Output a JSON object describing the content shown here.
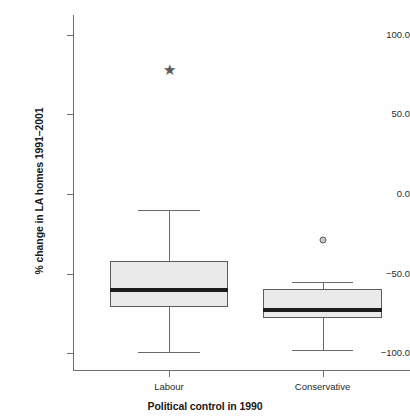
{
  "chart_data": {
    "type": "box",
    "title": "",
    "xlabel": "Political control in 1990",
    "ylabel": "% change in LA homes 1991–2001",
    "categories": [
      "Labour",
      "Conservative"
    ],
    "ylim": [
      -110.0,
      110.0
    ],
    "yticks": [
      100.0,
      50.0,
      0.0,
      -50.0,
      -100.0
    ],
    "ytick_labels": [
      "100.0",
      "50.0",
      "0.0",
      "−50.0",
      "−100.0"
    ],
    "grid": false,
    "legend": "none",
    "boxes": [
      {
        "category": "Labour",
        "whisker_low": -99.0,
        "q1": -71.2,
        "median": -60.5,
        "q3": -42.3,
        "whisker_high": -9.8,
        "outliers": [
          {
            "value": 78.2,
            "marker": "star"
          }
        ]
      },
      {
        "category": "Conservative",
        "whisker_low": -98.0,
        "q1": -77.7,
        "median": -72.7,
        "q3": -59.7,
        "whisker_high": -55.1,
        "outliers": [
          {
            "value": -29.1,
            "marker": "circle"
          }
        ]
      }
    ],
    "colors": {
      "box_fill": "#eaeaea",
      "box_edge": "#5c5c5c",
      "median": "#1c1c1c",
      "whisker": "#6a6a6a",
      "outlier": "#5a5a5a",
      "axis": "#6e6e6e",
      "text": "#1a1a1a",
      "background": "#fefefe"
    },
    "marker_glyphs": {
      "star": "★",
      "circle": "●"
    }
  }
}
